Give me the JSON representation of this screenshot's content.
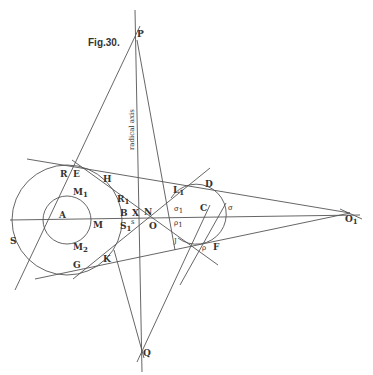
{
  "figure": {
    "title": "Fig.30.",
    "axis_label": "radical axis"
  },
  "points": {
    "P": "P",
    "Q": "Q",
    "R": "R",
    "E": "E",
    "H": "H",
    "S": "S",
    "A": "A",
    "M": "M",
    "M1": "M",
    "M2": "M",
    "G": "G",
    "K": "K",
    "B": "B",
    "R1": "R",
    "S1": "S",
    "X": "X",
    "N": "N",
    "O": "O",
    "s": "s",
    "L": "L",
    "D": "D",
    "C": "C",
    "sigma": "σ",
    "sigma1": "σ",
    "rho": "ρ",
    "rho1": "ρ",
    "J": "J",
    "F": "F",
    "O1": "O"
  },
  "subscripts": {
    "one": "1",
    "two": "2"
  },
  "colors": {
    "ink": "#555555",
    "text": "#333333",
    "paper": "#ffffff"
  }
}
